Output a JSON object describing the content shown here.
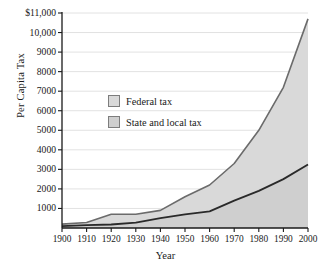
{
  "chart_data": {
    "type": "area",
    "title": "",
    "xlabel": "Year",
    "ylabel": "Per Capita Tax",
    "x": [
      1900,
      1910,
      1920,
      1930,
      1940,
      1950,
      1960,
      1970,
      1980,
      1990,
      2000
    ],
    "xlim": [
      1900,
      2000
    ],
    "ylim": [
      0,
      11000
    ],
    "stacked": true,
    "grid": true,
    "legend_position": "inside-upper-left",
    "series": [
      {
        "name": "State and local tax",
        "color": "#cfcfcf",
        "values": [
          100,
          150,
          180,
          280,
          500,
          700,
          850,
          1400,
          1900,
          2500,
          3250
        ]
      },
      {
        "name": "Federal tax",
        "color": "#d9d9d9",
        "values": [
          100,
          130,
          520,
          420,
          400,
          900,
          1350,
          1900,
          3100,
          4700,
          7450
        ]
      }
    ],
    "cumulative_totals": [
      200,
      280,
      700,
      700,
      900,
      1600,
      2200,
      3300,
      5000,
      7200,
      10700
    ],
    "xticks": [
      "1900",
      "1910",
      "1920",
      "1930",
      "1940",
      "1950",
      "1960",
      "1970",
      "1980",
      "1990",
      "2000"
    ],
    "yticks": [
      "$11,000",
      "10,000",
      "9000",
      "8000",
      "7000",
      "6000",
      "5000",
      "4000",
      "3000",
      "2000",
      "1000"
    ],
    "ytick_values": [
      11000,
      10000,
      9000,
      8000,
      7000,
      6000,
      5000,
      4000,
      3000,
      2000,
      1000
    ]
  },
  "legend": {
    "items": [
      {
        "label": "Federal tax"
      },
      {
        "label": "State and local tax"
      }
    ]
  },
  "colors": {
    "axis": "#1a1a1a",
    "gridline": "#e2e2e2",
    "federal_fill": "#d9d9d9",
    "state_fill": "#cfcfcf",
    "total_line": "#6b6b6b",
    "state_line": "#2a2a2a",
    "background": "#ffffff"
  }
}
